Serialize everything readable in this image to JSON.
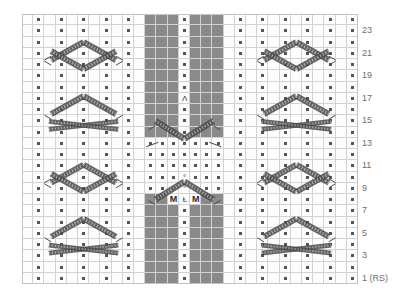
{
  "chart_data": {
    "type": "table",
    "columns": 30,
    "rows": 24,
    "xlabel": "",
    "ylabel": "",
    "grid": true,
    "legend_position": "none",
    "row_numbers": [
      "23",
      "21",
      "19",
      "17",
      "15",
      "13",
      "11",
      "9",
      "7",
      "5",
      "3",
      "1 (RS)"
    ],
    "row_number_rows": [
      23,
      21,
      19,
      17,
      15,
      13,
      11,
      9,
      7,
      5,
      3,
      1
    ],
    "colors": {
      "dark_cell": "#8a8a8a",
      "grid_line": "#d2d2d2",
      "outline": "#c2c2c2",
      "cable_stroke": "#4a4a4a",
      "dot": "#555555",
      "rownum_text": "#6e6e6e",
      "background": "#ffffff"
    },
    "cell_width": 11.2,
    "cell_height": 11.25,
    "dark_blocks": [
      {
        "name": "upper-left-block",
        "col_start": 12,
        "col_end": 14,
        "row_start": 14,
        "row_end": 24
      },
      {
        "name": "upper-right-block",
        "col_start": 16,
        "col_end": 18,
        "row_start": 14,
        "row_end": 24
      },
      {
        "name": "lower-left-block",
        "col_start": 12,
        "col_end": 14,
        "row_start": 1,
        "row_end": 8
      },
      {
        "name": "lower-right-block",
        "col_start": 16,
        "col_end": 18,
        "row_start": 1,
        "row_end": 8
      }
    ],
    "symbols": [
      {
        "name": "centered-double-decrease",
        "glyph": "Λ",
        "col": 15,
        "row": 17
      },
      {
        "name": "yarn-over-upper",
        "glyph": "°",
        "col": 15,
        "row": 10
      },
      {
        "name": "yarn-over-lower",
        "glyph": "°",
        "col": 15,
        "row": 9
      },
      {
        "name": "double-decrease-down",
        "glyph": "Ɫ",
        "col": 15,
        "row": 8
      },
      {
        "name": "make-one-left",
        "glyph": "M",
        "col": 14,
        "row": 8
      },
      {
        "name": "make-one-right",
        "glyph": "M",
        "col": 16,
        "row": 8
      }
    ],
    "purl_dot_note": "purl stitch",
    "cable_note": "cable crossing"
  }
}
